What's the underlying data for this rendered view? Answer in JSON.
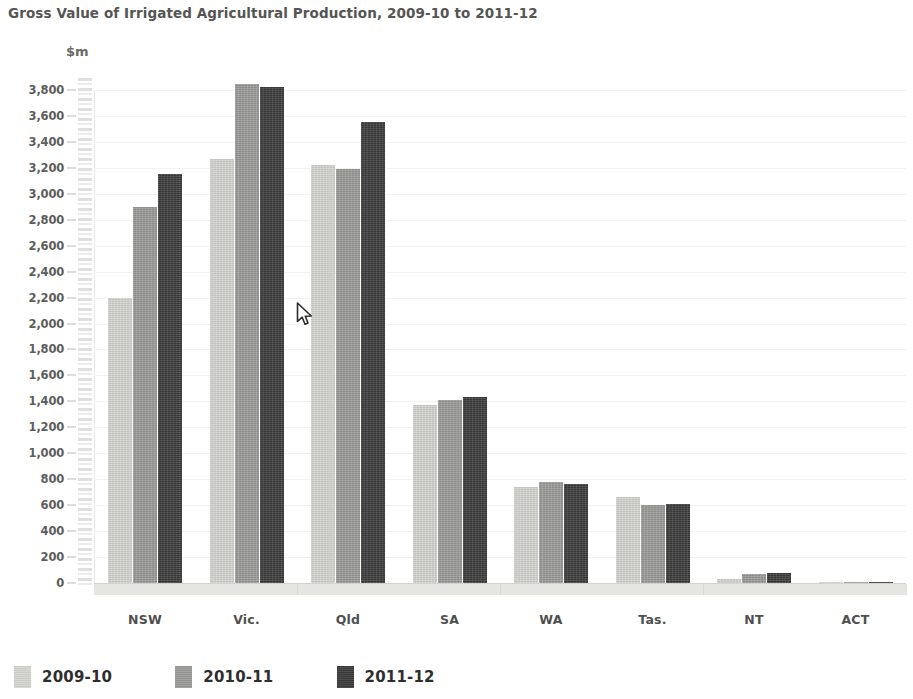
{
  "chart_data": {
    "type": "bar",
    "title": "Gross Value of Irrigated Agricultural Production, 2009-10 to 2011-12",
    "xlabel": "",
    "ylabel": "$m",
    "ylim": [
      0,
      3800
    ],
    "ytick_step": 200,
    "grid": true,
    "legend_position": "bottom-left",
    "categories": [
      "NSW",
      "Vic.",
      "Qld",
      "SA",
      "WA",
      "Tas.",
      "NT",
      "ACT"
    ],
    "ytick_labels": [
      "3,800",
      "3,600",
      "3,400",
      "3,200",
      "3,000",
      "2,800",
      "2,600",
      "2,400",
      "2,200",
      "2,000",
      "1,800",
      "1,600",
      "1,400",
      "1,200",
      "1,000",
      "800",
      "600",
      "400",
      "200",
      "0"
    ],
    "ytick_values": [
      3800,
      3600,
      3400,
      3200,
      3000,
      2800,
      2600,
      2400,
      2200,
      2000,
      1800,
      1600,
      1400,
      1200,
      1000,
      800,
      600,
      400,
      200,
      0
    ],
    "series": [
      {
        "name": "2009-10",
        "color": "#d4d4d0",
        "values": [
          2200,
          3270,
          3220,
          1370,
          740,
          660,
          30,
          5
        ]
      },
      {
        "name": "2010-11",
        "color": "#9a9a98",
        "values": [
          2900,
          3850,
          3190,
          1410,
          780,
          600,
          70,
          5
        ]
      },
      {
        "name": "2011-12",
        "color": "#3b3b3b",
        "values": [
          3150,
          3820,
          3550,
          1430,
          760,
          610,
          80,
          5
        ]
      }
    ]
  },
  "header": {
    "title": "Gross Value of Irrigated Agricultural Production, 2009-10 to 2011-12"
  },
  "axes": {
    "y_unit": "$m"
  },
  "legend": {
    "items": [
      {
        "label": "2009-10",
        "color": "#d4d4d0"
      },
      {
        "label": "2010-11",
        "color": "#9a9a98"
      },
      {
        "label": "2011-12",
        "color": "#3b3b3b"
      }
    ]
  },
  "cursor": {
    "x": 296,
    "y": 302
  }
}
